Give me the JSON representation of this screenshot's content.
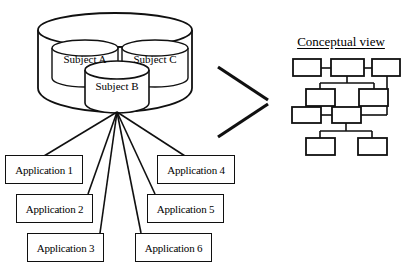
{
  "figure": {
    "title": "",
    "background_color": "#ffffff",
    "stroke_color": "#101010"
  },
  "warehouse": {
    "name": "data-warehouse-cylinder",
    "subjects": [
      {
        "id": "subject-a",
        "label": "Subject A"
      },
      {
        "id": "subject-c",
        "label": "Subject C"
      },
      {
        "id": "subject-b",
        "label": "Subject B"
      }
    ]
  },
  "applications": [
    {
      "id": "application-1",
      "label": "Application 1"
    },
    {
      "id": "application-2",
      "label": "Application 2"
    },
    {
      "id": "application-3",
      "label": "Application 3"
    },
    {
      "id": "application-4",
      "label": "Application 4"
    },
    {
      "id": "application-5",
      "label": "Application 5"
    },
    {
      "id": "application-6",
      "label": "Application 6"
    }
  ],
  "conceptual_view": {
    "title": "Conceptual view",
    "node_count": 11,
    "nodes": [
      {
        "id": "node-r1-a",
        "label": ""
      },
      {
        "id": "node-r1-b",
        "label": ""
      },
      {
        "id": "node-r1-c",
        "label": ""
      },
      {
        "id": "node-r2-a",
        "label": ""
      },
      {
        "id": "node-r2-b",
        "label": ""
      },
      {
        "id": "node-r3-a",
        "label": ""
      },
      {
        "id": "node-r3-b",
        "label": ""
      },
      {
        "id": "node-r4-a",
        "label": ""
      },
      {
        "id": "node-r4-b",
        "label": ""
      }
    ]
  },
  "arrow": {
    "name": "chevron-right-arrow",
    "label": ""
  }
}
